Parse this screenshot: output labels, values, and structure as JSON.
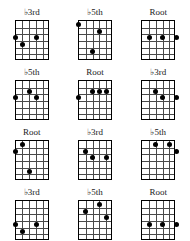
{
  "page": {
    "kind": "guitar-chord-diagram-sheet",
    "strings": 6,
    "frets": 6,
    "dot_color": "#000000",
    "grid_color": "#4a4a4a",
    "border_color": "#000000",
    "background": "#ffffff"
  },
  "chart_data": {
    "type": "table",
    "title": "",
    "xlabel": "",
    "ylabel": "",
    "categories": [
      "♭3rd",
      "♭5th",
      "Root"
    ],
    "values": [
      3,
      3,
      3
    ],
    "grid": true,
    "legend": "none"
  },
  "diagrams": [
    {
      "id": "r1c1",
      "label": "♭3rd",
      "label_prefix": "♭",
      "label_text": "3rd",
      "dots": [
        {
          "string": 0,
          "fret": 3
        },
        {
          "string": 1,
          "fret": 4
        },
        {
          "string": 3,
          "fret": 3
        }
      ]
    },
    {
      "id": "r1c2",
      "label": "♭5th",
      "label_prefix": "♭",
      "label_text": "5th",
      "dots": [
        {
          "string": 0,
          "fret": 1
        },
        {
          "string": 3,
          "fret": 2
        },
        {
          "string": 2,
          "fret": 5
        }
      ]
    },
    {
      "id": "r1c3",
      "label": "Root",
      "label_prefix": "",
      "label_text": "Root",
      "dots": [
        {
          "string": 1,
          "fret": 3
        },
        {
          "string": 3,
          "fret": 3
        },
        {
          "string": 5,
          "fret": 3
        }
      ]
    },
    {
      "id": "r2c1",
      "label": "♭5th",
      "label_prefix": "♭",
      "label_text": "5th",
      "dots": [
        {
          "string": 0,
          "fret": 3
        },
        {
          "string": 2,
          "fret": 2
        },
        {
          "string": 3,
          "fret": 3
        }
      ]
    },
    {
      "id": "r2c2",
      "label": "Root",
      "label_prefix": "",
      "label_text": "Root",
      "dots": [
        {
          "string": 0,
          "fret": 3
        },
        {
          "string": 2,
          "fret": 2
        },
        {
          "string": 3,
          "fret": 2
        },
        {
          "string": 4,
          "fret": 2
        }
      ]
    },
    {
      "id": "r2c3",
      "label": "♭3rd",
      "label_prefix": "♭",
      "label_text": "3rd",
      "dots": [
        {
          "string": 2,
          "fret": 2
        },
        {
          "string": 3,
          "fret": 3
        },
        {
          "string": 5,
          "fret": 3
        }
      ]
    },
    {
      "id": "r3c1",
      "label": "Root",
      "label_prefix": "",
      "label_text": "Root",
      "dots": [
        {
          "string": 0,
          "fret": 2
        },
        {
          "string": 1,
          "fret": 1
        },
        {
          "string": 2,
          "fret": 5
        }
      ]
    },
    {
      "id": "r3c2",
      "label": "♭3rd",
      "label_prefix": "♭",
      "label_text": "3rd",
      "dots": [
        {
          "string": 1,
          "fret": 2
        },
        {
          "string": 2,
          "fret": 3
        },
        {
          "string": 4,
          "fret": 3
        }
      ]
    },
    {
      "id": "r3c3",
      "label": "♭5th",
      "label_prefix": "♭",
      "label_text": "5th",
      "dots": [
        {
          "string": 2,
          "fret": 1
        },
        {
          "string": 4,
          "fret": 1
        },
        {
          "string": 5,
          "fret": 2
        }
      ]
    },
    {
      "id": "r4c1",
      "label": "♭3rd",
      "label_prefix": "♭",
      "label_text": "3rd",
      "dots": [
        {
          "string": 0,
          "fret": 4
        },
        {
          "string": 1,
          "fret": 5
        },
        {
          "string": 3,
          "fret": 4
        }
      ]
    },
    {
      "id": "r4c2",
      "label": "♭5th",
      "label_prefix": "♭",
      "label_text": "5th",
      "dots": [
        {
          "string": 1,
          "fret": 2
        },
        {
          "string": 3,
          "fret": 1
        },
        {
          "string": 4,
          "fret": 3
        }
      ]
    },
    {
      "id": "r4c3",
      "label": "Root",
      "label_prefix": "",
      "label_text": "Root",
      "dots": [
        {
          "string": 1,
          "fret": 4
        },
        {
          "string": 3,
          "fret": 4
        },
        {
          "string": 5,
          "fret": 4
        }
      ]
    }
  ]
}
